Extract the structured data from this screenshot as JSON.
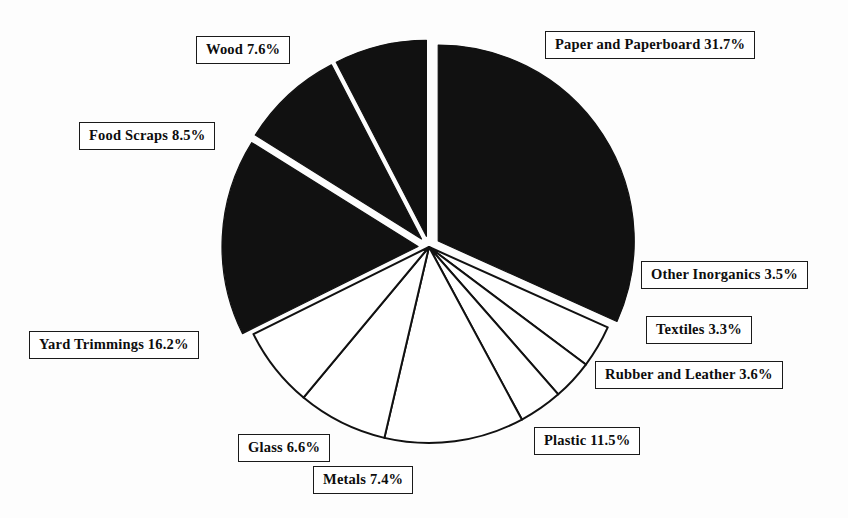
{
  "chart_data": {
    "type": "pie",
    "title": "",
    "subtitle": "",
    "xlabel": "",
    "ylabel": "",
    "legend_position": "none",
    "grid": false,
    "units": "percent",
    "categories": [
      "Paper and Paperboard",
      "Other Inorganics",
      "Textiles",
      "Rubber and Leather",
      "Plastic",
      "Metals",
      "Glass",
      "Yard Trimmings",
      "Food Scraps",
      "Wood"
    ],
    "values": [
      31.7,
      3.5,
      3.3,
      3.6,
      11.5,
      7.4,
      6.6,
      16.2,
      8.5,
      7.6
    ],
    "slices": [
      {
        "name": "Paper and Paperboard",
        "value": 31.7,
        "label": "Paper and Paperboard 31.7%",
        "fill": "#111111",
        "exploded": true,
        "label_left": 545,
        "label_top": 31
      },
      {
        "name": "Other Inorganics",
        "value": 3.5,
        "label": "Other Inorganics 3.5%",
        "fill": "#ffffff",
        "exploded": false,
        "label_left": 641,
        "label_top": 261
      },
      {
        "name": "Textiles",
        "value": 3.3,
        "label": "Textiles 3.3%",
        "fill": "#ffffff",
        "exploded": false,
        "label_left": 646,
        "label_top": 316
      },
      {
        "name": "Rubber and Leather",
        "value": 3.6,
        "label": "Rubber and Leather 3.6%",
        "fill": "#ffffff",
        "exploded": false,
        "label_left": 595,
        "label_top": 361
      },
      {
        "name": "Plastic",
        "value": 11.5,
        "label": "Plastic 11.5%",
        "fill": "#ffffff",
        "exploded": false,
        "label_left": 534,
        "label_top": 427
      },
      {
        "name": "Metals",
        "value": 7.4,
        "label": "Metals 7.4%",
        "fill": "#ffffff",
        "exploded": false,
        "label_left": 313,
        "label_top": 466
      },
      {
        "name": "Glass",
        "value": 6.6,
        "label": "Glass 6.6%",
        "fill": "#ffffff",
        "exploded": false,
        "label_left": 238,
        "label_top": 434
      },
      {
        "name": "Yard Trimmings",
        "value": 16.2,
        "label": "Yard Trimmings 16.2%",
        "fill": "#111111",
        "exploded": true,
        "label_left": 29,
        "label_top": 331
      },
      {
        "name": "Food Scraps",
        "value": 8.5,
        "label": "Food Scraps 8.5%",
        "fill": "#111111",
        "exploded": true,
        "label_left": 79,
        "label_top": 122
      },
      {
        "name": "Wood",
        "value": 7.6,
        "label": "Wood 7.6%",
        "fill": "#111111",
        "exploded": true,
        "label_left": 196,
        "label_top": 36
      }
    ],
    "geometry": {
      "center_x": 429,
      "center_y": 247,
      "radius": 196,
      "start_angle_deg": -90,
      "direction": "clockwise",
      "explode_offset": 11
    },
    "style": {
      "slice_outline": "#111111",
      "dark_fill": "#111111",
      "light_fill": "#ffffff",
      "background": "#fdfdfd",
      "label_border": "#1a1a1a"
    }
  }
}
